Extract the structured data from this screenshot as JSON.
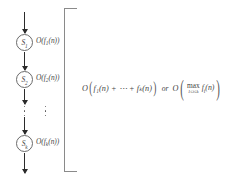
{
  "figure": {
    "background_color": "#ffffff",
    "ink_color": "#454545",
    "arrow_color": "#2b2b2b",
    "bracket_color": "#8a8a8a"
  },
  "chain": {
    "nodes": [
      {
        "id": "s1",
        "label": "S",
        "subscript": "1",
        "cost": "O(f",
        "cost_sub": "1",
        "cost_tail": "(n))"
      },
      {
        "id": "s2",
        "label": "S",
        "subscript": "2",
        "cost": "O(f",
        "cost_sub": "2",
        "cost_tail": "(n))"
      },
      {
        "id": "sk",
        "label": "S",
        "subscript": "k",
        "cost": "O(f",
        "cost_sub": "k",
        "cost_tail": "(n))"
      }
    ],
    "ellipsis_dots": 3,
    "arrows": [
      {
        "id": "arrow-into-s1"
      },
      {
        "id": "arrow-s1-to-s2"
      },
      {
        "id": "arrow-s2-to-dots"
      },
      {
        "id": "arrow-dots-to-sk"
      },
      {
        "id": "arrow-out-of-sk"
      }
    ]
  },
  "total": {
    "open_paren": "(",
    "close_paren": ")",
    "o_symbol": "O",
    "sum_expression": "f₁(n) + ⋯ + fₖ(n)",
    "or_label": "or",
    "max_word": "max",
    "max_subscript": "1≤i≤k",
    "max_argument": "f",
    "max_argument_sub": "i",
    "max_argument_tail": "(n)"
  }
}
